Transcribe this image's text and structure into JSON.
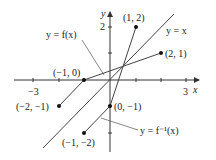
{
  "axes": {
    "x_label": "x",
    "y_label": "y",
    "x_ticks": [
      {
        "value": -3,
        "label": "−3"
      },
      {
        "value": 3,
        "label": "3"
      }
    ],
    "y_ticks": [
      {
        "value": 2,
        "label": "2"
      }
    ]
  },
  "curves": {
    "f": {
      "label": "y = f(x)",
      "points": [
        [
          -2,
          -1
        ],
        [
          -1,
          0
        ],
        [
          2,
          1
        ]
      ]
    },
    "f_inverse": {
      "label": "y = f⁻¹(x)",
      "points": [
        [
          -1,
          -2
        ],
        [
          0,
          -1
        ],
        [
          1,
          2
        ]
      ]
    },
    "identity": {
      "label": "y = x"
    }
  },
  "points": [
    {
      "label": "(1, 2)",
      "x": 1,
      "y": 2
    },
    {
      "label": "(2, 1)",
      "x": 2,
      "y": 1
    },
    {
      "label": "(−1, 0)",
      "x": -1,
      "y": 0
    },
    {
      "label": "(−2, −1)",
      "x": -2,
      "y": -1
    },
    {
      "label": "(0, −1)",
      "x": 0,
      "y": -1
    },
    {
      "label": "(−1, −2)",
      "x": -1,
      "y": -2
    }
  ]
}
